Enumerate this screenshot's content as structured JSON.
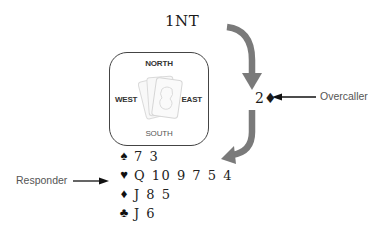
{
  "auction": {
    "opening_bid": "1NT",
    "overcall_bid": "2♦",
    "overcall_label": "Overcaller"
  },
  "compass": {
    "north": "NORTH",
    "south": "SOUTH",
    "west": "WEST",
    "east": "EAST",
    "center_icon": "playing-cards-icon"
  },
  "responder": {
    "label": "Responder",
    "hand": [
      {
        "suit": "spades",
        "symbol": "♠",
        "cards": "7 3"
      },
      {
        "suit": "hearts",
        "symbol": "♥",
        "cards": "Q 10 9 7 5 4"
      },
      {
        "suit": "diamonds",
        "symbol": "♦",
        "cards": "J 8 5"
      },
      {
        "suit": "clubs",
        "symbol": "♣",
        "cards": "J 6"
      }
    ]
  },
  "colors": {
    "flow_arrow": "#7a7a7a",
    "label_arrow": "#111111",
    "label_text": "#555555"
  }
}
